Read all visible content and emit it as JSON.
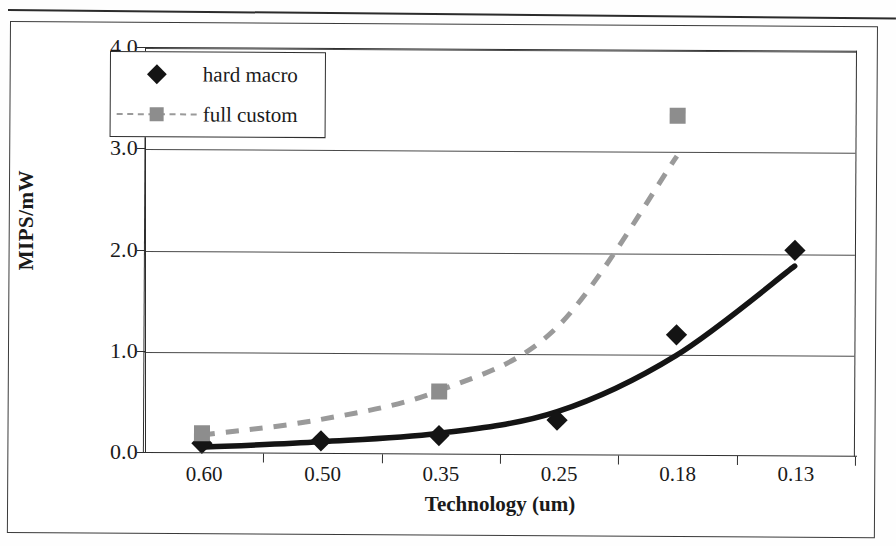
{
  "figure": {
    "caption_rule": true
  },
  "chart_data": {
    "type": "line",
    "title": "",
    "xlabel": "Technology (um)",
    "ylabel": "MIPS/mW",
    "categories": [
      "0.60",
      "0.50",
      "0.35",
      "0.25",
      "0.18",
      "0.13"
    ],
    "ylim": [
      0.0,
      4.0
    ],
    "yticks": [
      "0.0",
      "1.0",
      "2.0",
      "3.0",
      "4.0"
    ],
    "ytick_values": [
      0.0,
      1.0,
      2.0,
      3.0,
      4.0
    ],
    "grid": true,
    "legend_position": "top-left",
    "series": [
      {
        "name": "hard macro",
        "marker": "diamond",
        "color": "#141414",
        "line_style": "solid",
        "values": [
          0.09,
          0.12,
          0.18,
          0.34,
          1.19,
          2.02
        ],
        "trend_values": [
          0.05,
          0.11,
          0.2,
          0.42,
          0.98,
          1.87
        ]
      },
      {
        "name": "full custom",
        "marker": "square",
        "color": "#8d8d8d",
        "line_style": "dashed",
        "values": [
          0.19,
          null,
          0.61,
          null,
          3.35,
          null
        ],
        "trend_values": [
          0.17,
          0.33,
          0.62,
          1.26,
          2.95,
          null
        ]
      }
    ]
  },
  "legend": {
    "items": [
      {
        "label": "hard macro",
        "marker": "diamond",
        "color": "#141414"
      },
      {
        "label": "full custom",
        "marker": "square",
        "color": "#8d8d8d"
      }
    ]
  },
  "colors": {
    "hard_macro": "#141414",
    "full_custom": "#8d8d8d",
    "axis": "#2f2f2f",
    "grid": "#4a4a4a",
    "background": "#ffffff"
  }
}
